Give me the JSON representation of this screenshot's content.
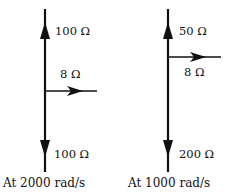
{
  "diagrams": [
    {
      "caption": "At 2000 rad/s",
      "up_label": "100 Ω",
      "right_label": "8 Ω",
      "down_label": "100 Ω"
    },
    {
      "caption": "At 1000 rad/s",
      "up_label": "50 Ω",
      "right_label": "8 Ω",
      "down_label": "200 Ω"
    }
  ],
  "colors": {
    "stroke": "#111111",
    "background": "#ffffff"
  }
}
